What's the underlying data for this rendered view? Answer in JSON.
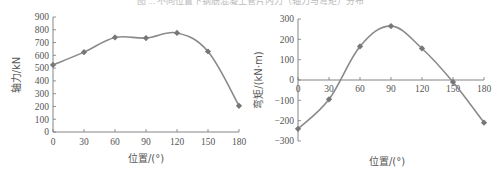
{
  "caption": "图 ... 不同位置下钢筋混凝土管片内力（轴力与弯矩）分布",
  "colors": {
    "line": "#8a8a8a",
    "marker": "#777777",
    "axis": "#777777",
    "text": "#555555"
  },
  "chart_data": [
    {
      "type": "line",
      "title": "",
      "xlabel": "位置/(°)",
      "ylabel": "轴力/kN",
      "x": [
        0,
        30,
        60,
        90,
        120,
        150,
        180
      ],
      "series": [
        {
          "name": "轴力",
          "values": [
            525,
            625,
            740,
            735,
            775,
            630,
            205
          ]
        }
      ],
      "xticks": [
        "0",
        "30",
        "60",
        "90",
        "120",
        "150",
        "180"
      ],
      "yticks": [
        "0",
        "100",
        "200",
        "300",
        "400",
        "500",
        "600",
        "700",
        "800",
        "900"
      ],
      "xlim": [
        0,
        180
      ],
      "ylim": [
        0,
        900
      ],
      "grid": false,
      "legend": null
    },
    {
      "type": "line",
      "title": "",
      "xlabel": "位置/(°)",
      "ylabel": "弯矩/(kN·m)",
      "x": [
        0,
        30,
        60,
        90,
        120,
        150,
        180
      ],
      "series": [
        {
          "name": "弯矩",
          "values": [
            -240,
            -95,
            165,
            265,
            155,
            -10,
            -210
          ]
        }
      ],
      "xticks": [
        "0",
        "30",
        "60",
        "90",
        "120",
        "150",
        "180"
      ],
      "yticks": [
        "-300",
        "-200",
        "-100",
        "0",
        "100",
        "200",
        "300"
      ],
      "xlim": [
        0,
        180
      ],
      "ylim": [
        -300,
        300
      ],
      "grid": false,
      "legend": null
    }
  ]
}
